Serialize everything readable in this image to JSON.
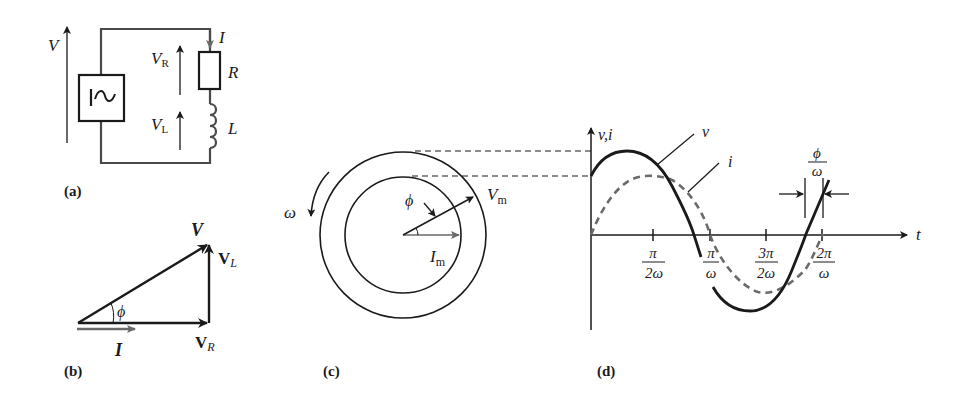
{
  "colors": {
    "ink": "#1a1a1a",
    "wire": "#4a4a4a",
    "current": "#6a6a6a",
    "background": "#ffffff"
  },
  "panel_a": {
    "tag": "(a)",
    "source_symbol": "~",
    "labels": {
      "V": "V",
      "VR_main": "V",
      "VR_sub": "R",
      "VL_main": "V",
      "VL_sub": "L",
      "I": "I",
      "R": "R",
      "L": "L"
    }
  },
  "panel_b": {
    "tag": "(b)",
    "labels": {
      "V": "V",
      "VL_main": "V",
      "VL_sub": "L",
      "VR_main": "V",
      "VR_sub": "R",
      "phi": "ϕ",
      "I": "I"
    }
  },
  "panel_c": {
    "tag": "(c)",
    "labels": {
      "omega": "ω",
      "phi": "ϕ",
      "Vm_main": "V",
      "Vm_sub": "m",
      "Im_main": "I",
      "Im_sub": "m"
    }
  },
  "panel_d": {
    "tag": "(d)",
    "labels": {
      "y_axis": "v,i",
      "x_axis": "t",
      "v_curve": "v",
      "i_curve": "i",
      "phase_num": "ϕ",
      "phase_den": "ω"
    },
    "ticks": [
      {
        "num": "π",
        "den": "2ω"
      },
      {
        "num": "π",
        "den": "ω"
      },
      {
        "num": "3π",
        "den": "2ω"
      },
      {
        "num": "2π",
        "den": "ω"
      }
    ]
  }
}
